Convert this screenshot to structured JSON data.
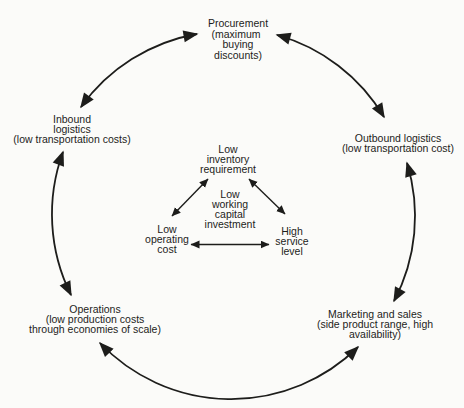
{
  "diagram": {
    "colors": {
      "ink": "#1d1d1b",
      "background": "#fbfbf9"
    },
    "nodes": {
      "procurement": {
        "lines": [
          "Procurement",
          "(maximum",
          "buying",
          "discounts)"
        ]
      },
      "inbound": {
        "lines": [
          "Inbound",
          "logistics",
          "(low transportation costs)"
        ]
      },
      "outbound": {
        "lines": [
          "Outbound logistics",
          "(low transportation cost)"
        ]
      },
      "operations": {
        "lines": [
          "Operations",
          "(low production costs",
          "through economies of scale)"
        ]
      },
      "marketing": {
        "lines": [
          "Marketing and sales",
          "(side product range, high",
          "availability)"
        ]
      }
    },
    "center": {
      "inventory": {
        "lines": [
          "Low",
          "inventory",
          "requirement"
        ]
      },
      "working_capital": {
        "lines": [
          "Low",
          "working",
          "capital",
          "investment"
        ]
      },
      "operating_cost": {
        "lines": [
          "Low",
          "operating",
          "cost"
        ]
      },
      "service_level": {
        "lines": [
          "High",
          "service",
          "level"
        ]
      }
    }
  }
}
